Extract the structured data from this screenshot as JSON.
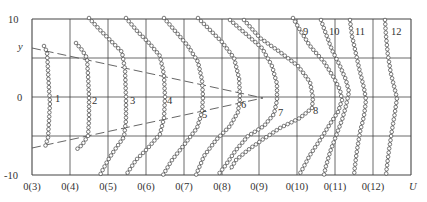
{
  "chart_data": {
    "type": "line",
    "title": "",
    "xlabel": "U",
    "ylabel": "y",
    "ylim": [
      -10,
      10
    ],
    "yticks": [
      "10",
      "0",
      "-10"
    ],
    "y_gridlines": [
      10,
      5,
      0,
      -5,
      -10
    ],
    "x_tick_labels": [
      "0(3)",
      "0(4)",
      "0(5)",
      "0(6)",
      "0(7)",
      "0(8)",
      "0(9)",
      "0(10)",
      "0(11)",
      "0(12)"
    ],
    "grid": true,
    "markers": "open-circle",
    "dashed_lines": [
      {
        "name": "upper-boundary",
        "from": [
          32,
          48
        ],
        "to": [
          263,
          98
        ]
      },
      {
        "name": "lower-boundary",
        "from": [
          32,
          148
        ],
        "to": [
          263,
          98
        ]
      }
    ],
    "series": [
      {
        "name": "1",
        "label_pos": [
          55,
          102
        ],
        "points": [
          [
            44,
            46
          ],
          [
            47,
            52
          ],
          [
            48,
            70
          ],
          [
            49,
            90
          ],
          [
            50,
            102
          ],
          [
            49,
            120
          ],
          [
            48,
            138
          ],
          [
            45,
            147
          ]
        ]
      },
      {
        "name": "2",
        "label_pos": [
          92,
          104
        ],
        "points": [
          [
            76,
            43
          ],
          [
            82,
            50
          ],
          [
            87,
            58
          ],
          [
            88,
            75
          ],
          [
            89,
            97
          ],
          [
            89,
            120
          ],
          [
            88,
            136
          ],
          [
            82,
            145
          ],
          [
            76,
            150
          ]
        ]
      },
      {
        "name": "3",
        "label_pos": [
          130,
          104
        ],
        "points": [
          [
            89,
            18
          ],
          [
            100,
            30
          ],
          [
            112,
            42
          ],
          [
            122,
            52
          ],
          [
            125,
            70
          ],
          [
            126,
            97
          ],
          [
            126,
            120
          ],
          [
            124,
            137
          ],
          [
            116,
            148
          ],
          [
            108,
            160
          ],
          [
            100,
            175
          ]
        ]
      },
      {
        "name": "4",
        "label_pos": [
          167,
          104
        ],
        "points": [
          [
            126,
            18
          ],
          [
            138,
            32
          ],
          [
            150,
            44
          ],
          [
            160,
            56
          ],
          [
            164,
            75
          ],
          [
            165,
            97
          ],
          [
            164,
            118
          ],
          [
            160,
            134
          ],
          [
            148,
            148
          ],
          [
            136,
            160
          ],
          [
            126,
            175
          ]
        ]
      },
      {
        "name": "5",
        "label_pos": [
          202,
          118
        ],
        "points": [
          [
            164,
            18
          ],
          [
            176,
            32
          ],
          [
            188,
            46
          ],
          [
            198,
            62
          ],
          [
            202,
            80
          ],
          [
            203,
            97
          ],
          [
            202,
            112
          ],
          [
            197,
            128
          ],
          [
            184,
            145
          ],
          [
            172,
            160
          ],
          [
            163,
            175
          ]
        ]
      },
      {
        "name": "6",
        "label_pos": [
          241,
          108
        ],
        "points": [
          [
            198,
            18
          ],
          [
            210,
            30
          ],
          [
            222,
            42
          ],
          [
            234,
            58
          ],
          [
            239,
            78
          ],
          [
            240,
            98
          ],
          [
            238,
            112
          ],
          [
            230,
            126
          ],
          [
            216,
            140
          ],
          [
            204,
            156
          ],
          [
            196,
            175
          ]
        ]
      },
      {
        "name": "7",
        "label_pos": [
          278,
          116
        ],
        "points": [
          [
            230,
            20
          ],
          [
            246,
            34
          ],
          [
            262,
            48
          ],
          [
            272,
            66
          ],
          [
            277,
            84
          ],
          [
            277,
            100
          ],
          [
            274,
            114
          ],
          [
            264,
            126
          ],
          [
            248,
            136
          ],
          [
            236,
            150
          ],
          [
            225,
            166
          ],
          [
            218,
            175
          ]
        ]
      },
      {
        "name": "8",
        "label_pos": [
          313,
          114
        ],
        "points": [
          [
            244,
            20
          ],
          [
            260,
            38
          ],
          [
            280,
            52
          ],
          [
            298,
            66
          ],
          [
            310,
            82
          ],
          [
            313,
            98
          ],
          [
            312,
            108
          ],
          [
            300,
            118
          ],
          [
            280,
            128
          ],
          [
            262,
            140
          ],
          [
            248,
            150
          ],
          [
            236,
            160
          ],
          [
            230,
            170
          ]
        ]
      },
      {
        "name": "9",
        "label_pos": [
          303,
          35
        ],
        "points": [
          [
            293,
            18
          ],
          [
            300,
            30
          ],
          [
            310,
            46
          ],
          [
            324,
            62
          ],
          [
            334,
            78
          ],
          [
            340,
            90
          ],
          [
            342,
            100
          ],
          [
            338,
            112
          ],
          [
            330,
            124
          ],
          [
            320,
            140
          ],
          [
            310,
            155
          ],
          [
            302,
            170
          ],
          [
            299,
            175
          ]
        ]
      },
      {
        "name": "10",
        "label_pos": [
          329,
          35
        ],
        "points": [
          [
            321,
            20
          ],
          [
            326,
            34
          ],
          [
            332,
            50
          ],
          [
            340,
            66
          ],
          [
            346,
            80
          ],
          [
            349,
            92
          ],
          [
            346,
            106
          ],
          [
            342,
            120
          ],
          [
            336,
            136
          ],
          [
            330,
            152
          ],
          [
            326,
            166
          ],
          [
            324,
            175
          ]
        ]
      },
      {
        "name": "11",
        "label_pos": [
          355,
          35
        ],
        "points": [
          [
            350,
            20
          ],
          [
            352,
            36
          ],
          [
            356,
            54
          ],
          [
            360,
            72
          ],
          [
            364,
            88
          ],
          [
            366,
            100
          ],
          [
            364,
            116
          ],
          [
            360,
            132
          ],
          [
            357,
            150
          ],
          [
            355,
            166
          ],
          [
            354,
            175
          ]
        ]
      },
      {
        "name": "12",
        "label_pos": [
          391,
          35
        ],
        "points": [
          [
            385,
            20
          ],
          [
            386,
            36
          ],
          [
            388,
            56
          ],
          [
            391,
            74
          ],
          [
            395,
            90
          ],
          [
            397,
            98
          ],
          [
            395,
            112
          ],
          [
            392,
            130
          ],
          [
            389,
            150
          ],
          [
            387,
            166
          ],
          [
            386,
            175
          ]
        ]
      }
    ]
  },
  "axes": {
    "y_label": "y",
    "x_label": "U",
    "y_top": "10",
    "y_mid": "0",
    "y_bottom": "-10"
  },
  "plot": {
    "left": 32,
    "right": 411,
    "top": 19,
    "bottom": 175,
    "v_lines": [
      32,
      70,
      108,
      146,
      184,
      222,
      259,
      297,
      335,
      373,
      411
    ],
    "h_lines": [
      19,
      58,
      97,
      136,
      175
    ],
    "x_label_positions": [
      32,
      70,
      108,
      146,
      184,
      222,
      259,
      297,
      335,
      373
    ],
    "grid_color": "#444444",
    "marker_color": "#444444",
    "dash_color": "#555555"
  }
}
